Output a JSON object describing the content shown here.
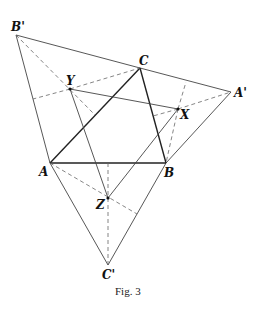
{
  "figure": {
    "caption": "Fig. 3",
    "points": {
      "A": {
        "label": "A",
        "x": 50,
        "y": 163
      },
      "B": {
        "label": "B",
        "x": 166,
        "y": 163
      },
      "C": {
        "label": "C",
        "x": 140,
        "y": 68
      },
      "A_prime": {
        "label": "A'",
        "x": 231,
        "y": 92
      },
      "B_prime": {
        "label": "B'",
        "x": 16,
        "y": 35
      },
      "C_prime": {
        "label": "C'",
        "x": 108,
        "y": 265
      },
      "X": {
        "label": "X",
        "x": 178,
        "y": 109
      },
      "Y": {
        "label": "Y",
        "x": 70,
        "y": 89
      },
      "Z": {
        "label": "Z",
        "x": 108,
        "y": 198
      }
    },
    "triangle_ABC": [
      "A",
      "B",
      "C"
    ],
    "outer_triangle": [
      "A_prime",
      "B_prime",
      "C_prime"
    ],
    "inner_triangle_XYZ": [
      "X",
      "Y",
      "Z"
    ]
  }
}
